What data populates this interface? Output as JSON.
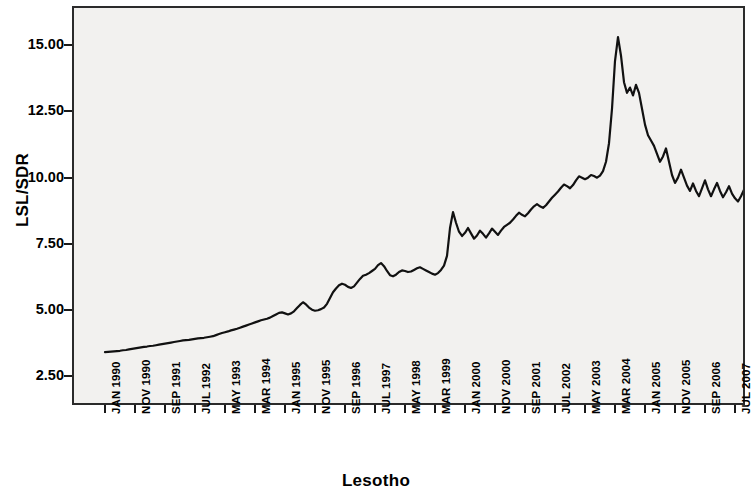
{
  "chart_data": {
    "type": "line",
    "title": "",
    "xlabel": "Lesotho",
    "ylabel": "LSL/SDR",
    "grid": false,
    "legend": false,
    "ylim": [
      1.5,
      16.4
    ],
    "yticks": [
      2.5,
      5.0,
      7.5,
      10.0,
      12.5,
      15.0
    ],
    "ytick_labels": [
      "2.50",
      "5.00",
      "7.50",
      "10.00",
      "12.50",
      "15.00"
    ],
    "x_start": "JAN 1990",
    "x_end": "DEC 2009",
    "x_interval": "monthly",
    "xtick_labels": [
      "JAN 1990",
      "NOV 1990",
      "SEP 1991",
      "JUL 1992",
      "MAY 1993",
      "MAR 1994",
      "JAN 1995",
      "NOV 1995",
      "SEP 1996",
      "JUL 1997",
      "MAY 1998",
      "MAR 1999",
      "JAN 2000",
      "NOV 2000",
      "SEP 2001",
      "JUL 2002",
      "MAY 2003",
      "MAR 2004",
      "JAN 2005",
      "NOV 2005",
      "SEP 2006",
      "JUL 2007",
      "MAY 2008",
      "MAR 2009"
    ],
    "xtick_indices": [
      0,
      10,
      20,
      30,
      40,
      50,
      60,
      70,
      80,
      90,
      100,
      110,
      120,
      130,
      140,
      150,
      160,
      170,
      180,
      190,
      200,
      210,
      220,
      230
    ],
    "series": [
      {
        "name": "LSL/SDR",
        "color": "#111111",
        "line_width": 2.2,
        "values": [
          3.42,
          3.43,
          3.44,
          3.45,
          3.46,
          3.47,
          3.49,
          3.5,
          3.52,
          3.54,
          3.56,
          3.58,
          3.6,
          3.62,
          3.63,
          3.65,
          3.66,
          3.68,
          3.7,
          3.72,
          3.74,
          3.76,
          3.78,
          3.8,
          3.82,
          3.84,
          3.86,
          3.87,
          3.88,
          3.9,
          3.92,
          3.94,
          3.95,
          3.96,
          3.98,
          4.0,
          4.02,
          4.06,
          4.1,
          4.14,
          4.17,
          4.2,
          4.24,
          4.27,
          4.3,
          4.34,
          4.38,
          4.42,
          4.46,
          4.5,
          4.54,
          4.58,
          4.62,
          4.65,
          4.68,
          4.72,
          4.78,
          4.84,
          4.9,
          4.92,
          4.88,
          4.84,
          4.88,
          4.96,
          5.08,
          5.2,
          5.3,
          5.22,
          5.1,
          5.02,
          4.98,
          5.0,
          5.04,
          5.1,
          5.24,
          5.46,
          5.68,
          5.82,
          5.94,
          6.0,
          5.96,
          5.88,
          5.84,
          5.9,
          6.04,
          6.18,
          6.3,
          6.34,
          6.4,
          6.48,
          6.56,
          6.7,
          6.78,
          6.66,
          6.48,
          6.32,
          6.28,
          6.34,
          6.44,
          6.5,
          6.48,
          6.44,
          6.46,
          6.52,
          6.58,
          6.62,
          6.56,
          6.5,
          6.44,
          6.38,
          6.34,
          6.4,
          6.52,
          6.68,
          7.05,
          8.1,
          8.7,
          8.3,
          7.96,
          7.8,
          7.92,
          8.1,
          7.9,
          7.7,
          7.82,
          8.0,
          7.88,
          7.74,
          7.9,
          8.08,
          7.96,
          7.84,
          8.0,
          8.14,
          8.22,
          8.3,
          8.42,
          8.56,
          8.68,
          8.6,
          8.54,
          8.66,
          8.8,
          8.92,
          9.0,
          8.92,
          8.86,
          8.96,
          9.1,
          9.24,
          9.36,
          9.48,
          9.62,
          9.74,
          9.68,
          9.6,
          9.72,
          9.9,
          10.05,
          10.0,
          9.94,
          10.0,
          10.1,
          10.06,
          10.0,
          10.08,
          10.25,
          10.6,
          11.3,
          12.6,
          14.4,
          15.3,
          14.6,
          13.6,
          13.2,
          13.4,
          13.1,
          13.5,
          13.2,
          12.6,
          12.0,
          11.6,
          11.4,
          11.2,
          10.9,
          10.6,
          10.8,
          11.1,
          10.6,
          10.1,
          9.8,
          10.0,
          10.3,
          10.0,
          9.7,
          9.5,
          9.78,
          9.5,
          9.3,
          9.6,
          9.9,
          9.56,
          9.3,
          9.56,
          9.8,
          9.5,
          9.26,
          9.45,
          9.68,
          9.4,
          9.22,
          9.1,
          9.3,
          9.55,
          9.34,
          9.16,
          9.0,
          9.2,
          9.45,
          9.64,
          9.4,
          9.22,
          9.4,
          9.62,
          9.48,
          9.26,
          9.06,
          8.9,
          9.0,
          9.3,
          9.7,
          10.1,
          10.3,
          10.05,
          9.8,
          10.0,
          10.35,
          10.7,
          11.1,
          10.9,
          10.6,
          10.75,
          11.0,
          10.8,
          10.55,
          10.7,
          11.0,
          11.3,
          11.7,
          12.2,
          12.8,
          13.2,
          13.0,
          12.6,
          12.35,
          12.55,
          12.9,
          13.4,
          14.1,
          14.9,
          15.4,
          15.1,
          14.2,
          13.0,
          12.4,
          12.0,
          11.7,
          11.85,
          12.05,
          11.8,
          11.65,
          11.78,
          11.9,
          11.82,
          11.74,
          11.7
        ]
      }
    ]
  },
  "axes": {
    "ylabel": "LSL/SDR",
    "xlabel": "Lesotho"
  }
}
